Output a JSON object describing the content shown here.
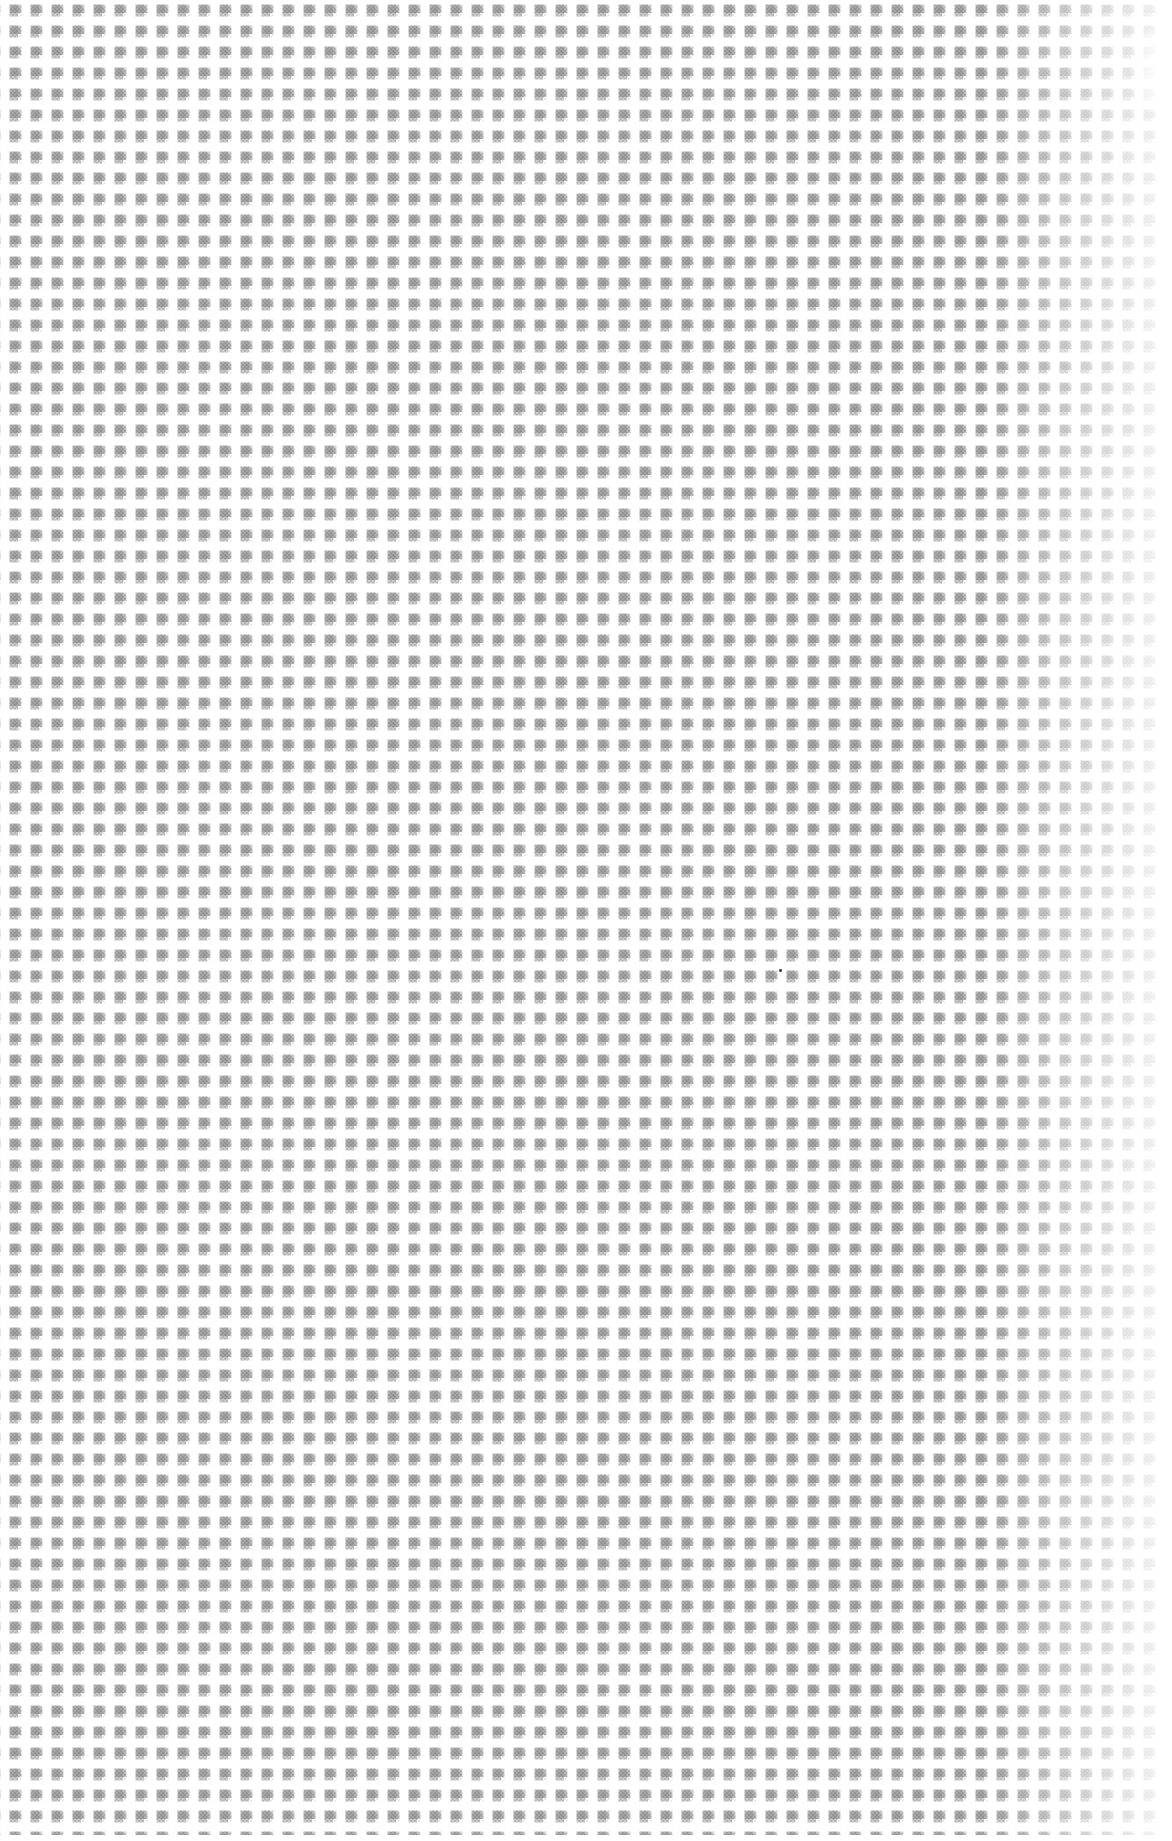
{
  "page": {
    "width": 1172,
    "height": 1841,
    "background_color": "#ffffff"
  },
  "pattern": {
    "type": "halftone-dot-screen",
    "shape": "square",
    "pitch_x": 21,
    "pitch_y": 21,
    "dot_size": 11,
    "dot_color": "#b9b9b9",
    "dot_color_dark": "#9e9e9e",
    "gap_color": "#ffffff",
    "edge_softness": "blurred",
    "interior_texture": "cross-hatch dither",
    "origin_x": 5,
    "origin_y": 0,
    "extent_right": 1155,
    "extent_bottom": 1835,
    "top_row_clipped": true
  },
  "artifacts": {
    "right_edge_fade": {
      "start_x": 985,
      "end_x": 1172,
      "note": "pattern fades toward white at the right page edge"
    },
    "smudge": {
      "x": 1140,
      "y": 30,
      "width": 32,
      "height": 82,
      "note": "faint lighter smudge at upper right edge"
    },
    "speck": {
      "x": 779,
      "y": 969,
      "width": 3,
      "height": 3,
      "color": "#464646",
      "note": "single small dark speck"
    },
    "margins": {
      "right_px": 16,
      "bottom_px": 6,
      "left_px": 5,
      "top_px": 0
    }
  }
}
